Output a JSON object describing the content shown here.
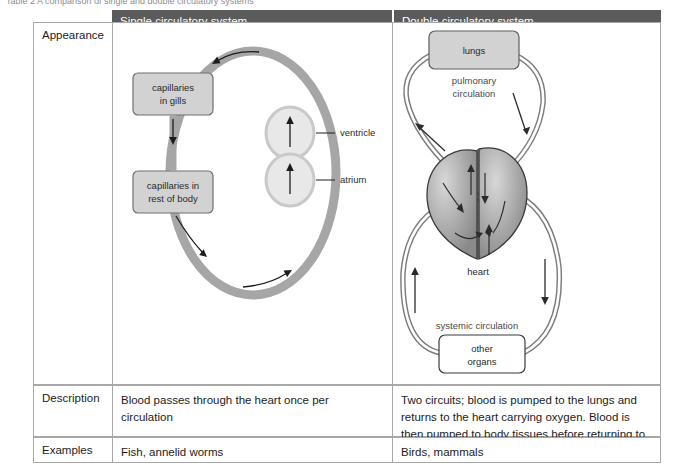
{
  "caption": "Table 2 A comparison of single and double circulatory systems",
  "table": {
    "headers": {
      "single": "Single circulatory system",
      "double": "Double circulatory system"
    },
    "rows": {
      "appearance": {
        "label": "Appearance"
      },
      "description": {
        "label": "Description",
        "single": "Blood passes through the heart once per circulation",
        "double": "Two circuits; blood is pumped to the lungs and returns to the heart carrying oxygen. Blood is then pumped to body tissues before returning to the heart."
      },
      "examples": {
        "label": "Examples",
        "single": "Fish, annelid worms",
        "double": "Birds, mammals"
      }
    }
  },
  "single_diagram": {
    "capillaries_gills": "capillaries\nin gills",
    "capillaries_gills_line1": "capillaries",
    "capillaries_gills_line2": "in gills",
    "capillaries_body_line1": "capillaries in",
    "capillaries_body_line2": "rest of body",
    "ventricle": "ventricle",
    "atrium": "atrium"
  },
  "double_diagram": {
    "lungs": "lungs",
    "pulmonary_line1": "pulmonary",
    "pulmonary_line2": "circulation",
    "heart": "heart",
    "systemic": "systemic circulation",
    "other_organs_line1": "other",
    "other_organs_line2": "organs"
  },
  "colors": {
    "header_bar": "#5b5b5b",
    "vessel_grey": "#a6a6a6",
    "box_fill": "#d2d2d2",
    "chamber_fill": "#e4e4e4",
    "border": "#a8a8a8",
    "ink": "#2a2a2a"
  }
}
